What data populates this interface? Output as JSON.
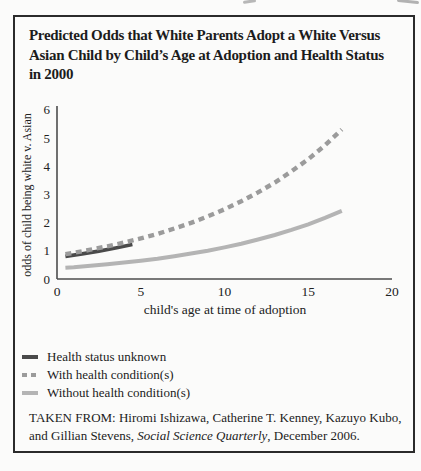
{
  "figure": {
    "title_lines": [
      "Predicted Odds that White Parents Adopt a White Versus",
      "Asian Child by Child’s Age at Adoption and Health Status",
      "in 2000"
    ],
    "source": {
      "line1": "TAKEN FROM: Hiromi Ishizawa, Catherine T. Kenney, Kazuyo Kubo,",
      "line2_prefix": "and Gillian Stevens, ",
      "line2_journal": "Social Science Quarterly",
      "line2_suffix": ", December 2006."
    },
    "border_color": "#2b2b2b"
  },
  "chart_data": {
    "type": "line",
    "xlabel": "child's age at time of adoption",
    "ylabel": "odds of child being white v. Asian",
    "xlim": [
      0,
      20
    ],
    "ylim": [
      0,
      6
    ],
    "x_ticks": [
      0,
      5,
      10,
      15,
      20
    ],
    "y_ticks": [
      0,
      1,
      2,
      3,
      4,
      5,
      6
    ],
    "grid": false,
    "legend_position": "below-chart-left",
    "axis_color": "#4d4d4d",
    "series": [
      {
        "name": "Health status unknown",
        "style": "solid",
        "color": "#4a4a4a",
        "width": 3.6,
        "points": [
          [
            0.5,
            0.8
          ],
          [
            1.5,
            0.89
          ],
          [
            2.5,
            0.99
          ],
          [
            3.5,
            1.1
          ],
          [
            4.5,
            1.22
          ]
        ]
      },
      {
        "name": "With health condition(s)",
        "style": "dashed",
        "color": "#9b9b9b",
        "width": 4.4,
        "points": [
          [
            0.5,
            0.88
          ],
          [
            1,
            0.93
          ],
          [
            2,
            1.04
          ],
          [
            3,
            1.16
          ],
          [
            4,
            1.29
          ],
          [
            5,
            1.44
          ],
          [
            6,
            1.6
          ],
          [
            7,
            1.79
          ],
          [
            8,
            1.99
          ],
          [
            9,
            2.22
          ],
          [
            10,
            2.47
          ],
          [
            11,
            2.76
          ],
          [
            12,
            3.07
          ],
          [
            13,
            3.42
          ],
          [
            14,
            3.82
          ],
          [
            15,
            4.25
          ],
          [
            16,
            4.74
          ],
          [
            17,
            5.3
          ]
        ]
      },
      {
        "name": "Without health condition(s)",
        "style": "solid",
        "color": "#b4b4b4",
        "width": 4,
        "points": [
          [
            0.5,
            0.4
          ],
          [
            1,
            0.42
          ],
          [
            2,
            0.47
          ],
          [
            3,
            0.52
          ],
          [
            4,
            0.58
          ],
          [
            5,
            0.65
          ],
          [
            6,
            0.72
          ],
          [
            7,
            0.81
          ],
          [
            8,
            0.9
          ],
          [
            9,
            1.0
          ],
          [
            10,
            1.12
          ],
          [
            11,
            1.25
          ],
          [
            12,
            1.4
          ],
          [
            13,
            1.56
          ],
          [
            14,
            1.74
          ],
          [
            15,
            1.94
          ],
          [
            16,
            2.17
          ],
          [
            17,
            2.42
          ]
        ]
      }
    ]
  }
}
